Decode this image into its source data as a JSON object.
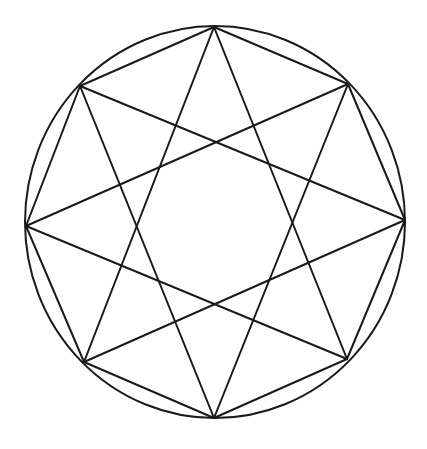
{
  "diagram": {
    "stroke_color": "#1a1a1a",
    "background": "#ffffff",
    "circle": {
      "cx": 215,
      "cy": 222,
      "rx": 190,
      "ry": 196
    },
    "vertices": [
      {
        "name": "top",
        "x": 214,
        "y": 27
      },
      {
        "name": "top-right",
        "x": 348,
        "y": 84
      },
      {
        "name": "right",
        "x": 405,
        "y": 220
      },
      {
        "name": "bottom-right",
        "x": 347,
        "y": 359
      },
      {
        "name": "bottom",
        "x": 214,
        "y": 418
      },
      {
        "name": "bottom-left",
        "x": 84,
        "y": 362
      },
      {
        "name": "left",
        "x": 26,
        "y": 226
      },
      {
        "name": "top-left",
        "x": 80,
        "y": 86
      }
    ],
    "octagon_edges_step": 1,
    "star_step": 3
  }
}
